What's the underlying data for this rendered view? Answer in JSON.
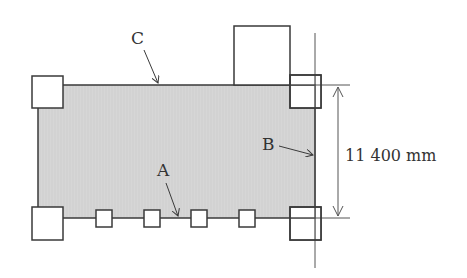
{
  "diagram": {
    "type": "plan-view",
    "colors": {
      "fill": "#d4d4d4",
      "stroke": "#3a3a3a",
      "thin_line": "#555555",
      "text": "#333333",
      "background": "#ffffff"
    },
    "slab": {
      "x": 38,
      "y": 85,
      "width": 277,
      "height": 133
    },
    "corner_columns": [
      {
        "name": "top-left",
        "x": 32,
        "y": 76,
        "w": 31,
        "h": 32
      },
      {
        "name": "top-right",
        "x": 290,
        "y": 75,
        "w": 31,
        "h": 33
      },
      {
        "name": "bottom-left",
        "x": 32,
        "y": 207,
        "w": 31,
        "h": 33
      },
      {
        "name": "bottom-right",
        "x": 290,
        "y": 207,
        "w": 31,
        "h": 33
      }
    ],
    "top_box": {
      "x": 234,
      "y": 26,
      "w": 56,
      "h": 59
    },
    "edge_squares": [
      {
        "x": 96,
        "y": 210,
        "w": 16,
        "h": 17
      },
      {
        "x": 144,
        "y": 210,
        "w": 16,
        "h": 17
      },
      {
        "x": 191,
        "y": 210,
        "w": 16,
        "h": 17
      },
      {
        "x": 239,
        "y": 210,
        "w": 16,
        "h": 17
      }
    ],
    "labels": {
      "A": "A",
      "B": "B",
      "C": "C"
    },
    "dimension": {
      "text": "11 400 mm",
      "value": 11400,
      "unit": "mm"
    }
  }
}
